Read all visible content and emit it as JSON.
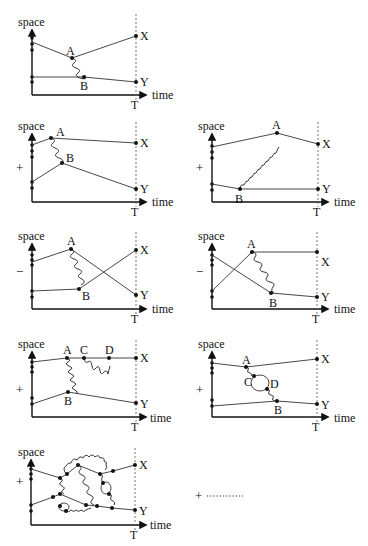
{
  "figure": {
    "axis_labels": {
      "y": "space",
      "x": "time",
      "t_marker": "T"
    },
    "endpoint_labels": {
      "top": "X",
      "bottom": "Y"
    },
    "continuation": {
      "sign": "+",
      "dots": "···········"
    },
    "panels": [
      {
        "id": 1,
        "sign": "",
        "vertex_labels": [
          "A",
          "B"
        ],
        "description": "single photon exchange between A and B"
      },
      {
        "id": 2,
        "sign": "+",
        "vertex_labels": [
          "A",
          "B"
        ],
        "description": "exchange with paths crossing upward"
      },
      {
        "id": 3,
        "sign": "+",
        "vertex_labels": [
          "A",
          "B"
        ],
        "description": "long-range exchange, B early, A late"
      },
      {
        "id": 4,
        "sign": "−",
        "vertex_labels": [
          "A",
          "B"
        ],
        "description": "exchange with crossed final states"
      },
      {
        "id": 5,
        "sign": "−",
        "vertex_labels": [
          "A",
          "B"
        ],
        "description": "crossed initial paths with exchange"
      },
      {
        "id": 6,
        "sign": "+",
        "vertex_labels": [
          "A",
          "C",
          "D",
          "B"
        ],
        "description": "exchange plus self-energy loop C–D on upper line"
      },
      {
        "id": 7,
        "sign": "+",
        "vertex_labels": [
          "A",
          "C",
          "D",
          "B"
        ],
        "description": "exchange with vacuum polarization loop C–D"
      },
      {
        "id": 8,
        "sign": "+",
        "vertex_labels": [],
        "description": "higher-order multi-photon diagram with loops"
      }
    ]
  }
}
